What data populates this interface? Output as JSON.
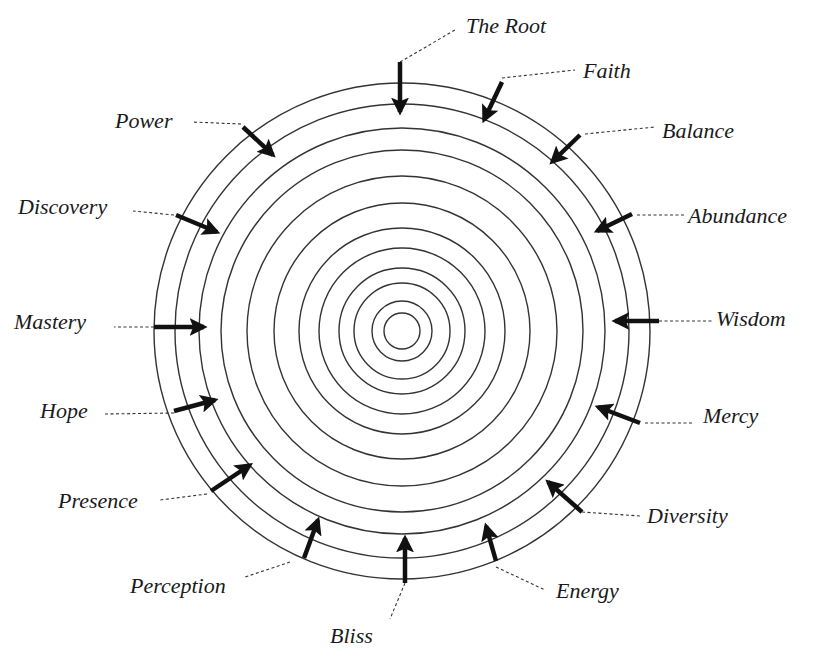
{
  "diagram": {
    "center": {
      "x": 402,
      "y": 331
    },
    "ring_radii": [
      248,
      227,
      203,
      181,
      155,
      128,
      103,
      83,
      63,
      48,
      30,
      18
    ],
    "colors": {
      "ring": "#333333",
      "arrow": "#111111",
      "text": "#1a1a1a",
      "background": "#ffffff"
    },
    "labels": [
      {
        "id": "the-root",
        "text": "The Root",
        "x": 466,
        "y": 15
      },
      {
        "id": "faith",
        "text": "Faith",
        "x": 583,
        "y": 60
      },
      {
        "id": "balance",
        "text": "Balance",
        "x": 662,
        "y": 120
      },
      {
        "id": "abundance",
        "text": "Abundance",
        "x": 688,
        "y": 205
      },
      {
        "id": "wisdom",
        "text": "Wisdom",
        "x": 716,
        "y": 308
      },
      {
        "id": "mercy",
        "text": "Mercy",
        "x": 703,
        "y": 405
      },
      {
        "id": "diversity",
        "text": "Diversity",
        "x": 647,
        "y": 505
      },
      {
        "id": "energy",
        "text": "Energy",
        "x": 556,
        "y": 580
      },
      {
        "id": "bliss",
        "text": "Bliss",
        "x": 330,
        "y": 625
      },
      {
        "id": "perception",
        "text": "Perception",
        "x": 130,
        "y": 575
      },
      {
        "id": "presence",
        "text": "Presence",
        "x": 58,
        "y": 490
      },
      {
        "id": "hope",
        "text": "Hope",
        "x": 40,
        "y": 400
      },
      {
        "id": "mastery",
        "text": "Mastery",
        "x": 14,
        "y": 311
      },
      {
        "id": "discovery",
        "text": "Discovery",
        "x": 18,
        "y": 196
      },
      {
        "id": "power",
        "text": "Power",
        "x": 115,
        "y": 110
      }
    ],
    "arrows": [
      {
        "id": "the-root",
        "tail": [
          400,
          62
        ],
        "head": [
          400,
          112
        ],
        "leader": [
          [
            400,
            62
          ],
          [
            455,
            30
          ]
        ]
      },
      {
        "id": "faith",
        "tail": [
          502,
          82
        ],
        "head": [
          484,
          120
        ],
        "leader": [
          [
            502,
            78
          ],
          [
            575,
            70
          ]
        ]
      },
      {
        "id": "balance",
        "tail": [
          580,
          135
        ],
        "head": [
          552,
          162
        ],
        "leader": [
          [
            585,
            134
          ],
          [
            655,
            127
          ]
        ]
      },
      {
        "id": "abundance",
        "tail": [
          632,
          214
        ],
        "head": [
          597,
          231
        ],
        "leader": [
          [
            637,
            215
          ],
          [
            684,
            215
          ]
        ]
      },
      {
        "id": "wisdom",
        "tail": [
          659,
          321
        ],
        "head": [
          615,
          321
        ],
        "leader": [
          [
            659,
            321
          ],
          [
            712,
            321
          ]
        ]
      },
      {
        "id": "mercy",
        "tail": [
          640,
          423
        ],
        "head": [
          598,
          407
        ],
        "leader": [
          [
            645,
            423
          ],
          [
            693,
            423
          ]
        ]
      },
      {
        "id": "diversity",
        "tail": [
          582,
          512
        ],
        "head": [
          548,
          482
        ],
        "leader": [
          [
            582,
            512
          ],
          [
            640,
            516
          ]
        ]
      },
      {
        "id": "energy",
        "tail": [
          496,
          561
        ],
        "head": [
          486,
          526
        ],
        "leader": [
          [
            496,
            567
          ],
          [
            545,
            590
          ]
        ]
      },
      {
        "id": "bliss",
        "tail": [
          405,
          583
        ],
        "head": [
          405,
          538
        ],
        "leader": [
          [
            405,
            583
          ],
          [
            390,
            619
          ]
        ]
      },
      {
        "id": "perception",
        "tail": [
          304,
          558
        ],
        "head": [
          318,
          520
        ],
        "leader": [
          [
            290,
            562
          ],
          [
            245,
            577
          ]
        ]
      },
      {
        "id": "presence",
        "tail": [
          211,
          491
        ],
        "head": [
          250,
          465
        ],
        "leader": [
          [
            207,
            494
          ],
          [
            160,
            500
          ]
        ]
      },
      {
        "id": "hope",
        "tail": [
          174,
          411
        ],
        "head": [
          215,
          400
        ],
        "leader": [
          [
            174,
            413
          ],
          [
            105,
            414
          ]
        ]
      },
      {
        "id": "mastery",
        "tail": [
          154,
          327
        ],
        "head": [
          204,
          327
        ],
        "leader": [
          [
            154,
            327
          ],
          [
            114,
            327
          ]
        ]
      },
      {
        "id": "discovery",
        "tail": [
          176,
          215
        ],
        "head": [
          217,
          232
        ],
        "leader": [
          [
            174,
            215
          ],
          [
            133,
            211
          ]
        ]
      },
      {
        "id": "power",
        "tail": [
          243,
          127
        ],
        "head": [
          273,
          155
        ],
        "leader": [
          [
            241,
            124
          ],
          [
            192,
            122
          ]
        ]
      }
    ]
  }
}
